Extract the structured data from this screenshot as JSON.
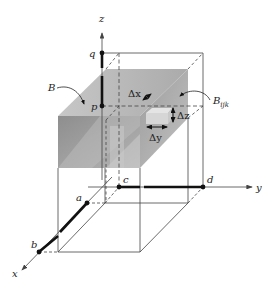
{
  "diagram": {
    "axes": {
      "x": "x",
      "y": "y",
      "z": "z"
    },
    "points": {
      "a": "a",
      "b": "b",
      "c": "c",
      "d": "d",
      "p": "p",
      "q": "q"
    },
    "solid_label": "B",
    "subbox_label": {
      "base": "B",
      "sub": "ijk"
    },
    "increments": {
      "dx": "Δx",
      "dy": "Δy",
      "dz": "Δz"
    },
    "colors": {
      "shade_front": "#9a9a9a",
      "shade_top": "#b8b8b8",
      "shade_side": "#a8a8a8",
      "line": "#333333",
      "thick": "#111111"
    }
  }
}
